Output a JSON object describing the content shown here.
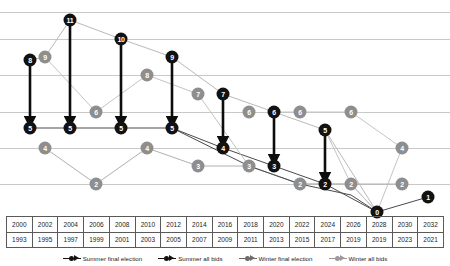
{
  "chart_data": {
    "type": "line",
    "title": "",
    "xlabel": "",
    "ylabel": "",
    "ylim": [
      0,
      12
    ],
    "grid": true,
    "gridline_values": [
      0,
      2,
      4,
      6,
      8,
      10,
      12
    ],
    "legend_position": "bottom",
    "x_axis": {
      "summer_years": [
        "2000",
        "2002",
        "2004",
        "2006",
        "2008",
        "2010",
        "2012",
        "2014",
        "2016",
        "2018",
        "2020",
        "2022",
        "2024",
        "2026",
        "2028",
        "2030",
        "2032"
      ],
      "winter_years": [
        "1993",
        "1995",
        "1997",
        "1999",
        "2001",
        "2003",
        "2005",
        "2007",
        "2009",
        "2011",
        "2013",
        "2015",
        "2017",
        "2019",
        "2019",
        "2023",
        "2021"
      ]
    },
    "series": [
      {
        "name": "Summer final election",
        "color": "#121212",
        "style": "dark",
        "points": [
          {
            "x": "2000",
            "value": 5
          },
          {
            "x": "2004",
            "value": 5
          },
          {
            "x": "2008",
            "value": 5
          },
          {
            "x": "2012",
            "value": 5
          },
          {
            "x": "2016",
            "value": 4
          },
          {
            "x": "2020",
            "value": 3
          },
          {
            "x": "2024",
            "value": 2
          },
          {
            "x": "2028",
            "value": 0
          },
          {
            "x": "2032",
            "value": 1
          }
        ]
      },
      {
        "name": "Summer all bids",
        "color": "#8e8e8e",
        "style": "gray",
        "points": [
          {
            "x": "2000",
            "value": 8
          },
          {
            "x": "2002",
            "value": 9
          },
          {
            "x": "2004",
            "value": 11
          },
          {
            "x": "2008",
            "value": 10
          },
          {
            "x": "2012",
            "value": 9
          },
          {
            "x": "2016",
            "value": 7
          },
          {
            "x": "2020",
            "value": 6
          },
          {
            "x": "2024",
            "value": 5
          },
          {
            "x": "2028",
            "value": 0
          }
        ]
      },
      {
        "name": "Winter final election",
        "color": "#121212",
        "style": "dark",
        "points": [
          {
            "x": "1993",
            "value": 4
          },
          {
            "x": "1999",
            "value": 2
          },
          {
            "x": "2003",
            "value": 4
          },
          {
            "x": "2009",
            "value": 3
          },
          {
            "x": "2013",
            "value": 3
          },
          {
            "x": "2017",
            "value": 2
          },
          {
            "x": "2021",
            "value": 2
          }
        ]
      },
      {
        "name": "Winter all bids",
        "color": "#8e8e8e",
        "style": "gray",
        "points": [
          {
            "x": "1995",
            "value": 6
          },
          {
            "x": "2001",
            "value": 8
          },
          {
            "x": "2005",
            "value": 7
          },
          {
            "x": "2011",
            "value": 6
          },
          {
            "x": "2015",
            "value": 6
          },
          {
            "x": "2019",
            "value": 6
          },
          {
            "x": "2023",
            "value": 4
          }
        ]
      }
    ],
    "markers": [
      {
        "id": "m1",
        "label": "8",
        "tone": "dark",
        "x": 30,
        "y": 60
      },
      {
        "id": "m2",
        "label": "5",
        "tone": "dark",
        "x": 30,
        "y": 128
      },
      {
        "id": "m3",
        "label": "9",
        "tone": "gray",
        "x": 45,
        "y": 57
      },
      {
        "id": "m4",
        "label": "11",
        "tone": "dark",
        "x": 70,
        "y": 20
      },
      {
        "id": "m5",
        "label": "5",
        "tone": "dark",
        "x": 70,
        "y": 128
      },
      {
        "id": "m6",
        "label": "6",
        "tone": "gray",
        "x": 96,
        "y": 112
      },
      {
        "id": "m7",
        "label": "10",
        "tone": "dark",
        "x": 121,
        "y": 39
      },
      {
        "id": "m8",
        "label": "5",
        "tone": "dark",
        "x": 121,
        "y": 128
      },
      {
        "id": "m9",
        "label": "8",
        "tone": "gray",
        "x": 147,
        "y": 75
      },
      {
        "id": "m10",
        "label": "9",
        "tone": "dark",
        "x": 172,
        "y": 57
      },
      {
        "id": "m11",
        "label": "5",
        "tone": "dark",
        "x": 172,
        "y": 128
      },
      {
        "id": "m12",
        "label": "7",
        "tone": "gray",
        "x": 198,
        "y": 94
      },
      {
        "id": "m13",
        "label": "7",
        "tone": "dark",
        "x": 223,
        "y": 94
      },
      {
        "id": "m14",
        "label": "4",
        "tone": "dark",
        "x": 223,
        "y": 148
      },
      {
        "id": "m15",
        "label": "6",
        "tone": "gray",
        "x": 249,
        "y": 112
      },
      {
        "id": "m16",
        "label": "6",
        "tone": "dark",
        "x": 274,
        "y": 112
      },
      {
        "id": "m17",
        "label": "3",
        "tone": "dark",
        "x": 274,
        "y": 166
      },
      {
        "id": "m18",
        "label": "6",
        "tone": "gray",
        "x": 300,
        "y": 112
      },
      {
        "id": "m19",
        "label": "5",
        "tone": "dark",
        "x": 325,
        "y": 130
      },
      {
        "id": "m20",
        "label": "2",
        "tone": "dark",
        "x": 325,
        "y": 184
      },
      {
        "id": "m21",
        "label": "6",
        "tone": "gray",
        "x": 351,
        "y": 112
      },
      {
        "id": "m22",
        "label": "0",
        "tone": "dark",
        "x": 377,
        "y": 212
      },
      {
        "id": "m23",
        "label": "4",
        "tone": "gray",
        "x": 402,
        "y": 148
      },
      {
        "id": "m24",
        "label": "1",
        "tone": "dark",
        "x": 428,
        "y": 197
      },
      {
        "id": "m25",
        "label": "4",
        "tone": "gray",
        "x": 45,
        "y": 148
      },
      {
        "id": "m26",
        "label": "2",
        "tone": "gray",
        "x": 96,
        "y": 184
      },
      {
        "id": "m27",
        "label": "4",
        "tone": "gray",
        "x": 147,
        "y": 148
      },
      {
        "id": "m28",
        "label": "3",
        "tone": "gray",
        "x": 198,
        "y": 166
      },
      {
        "id": "m29",
        "label": "3",
        "tone": "gray",
        "x": 249,
        "y": 166
      },
      {
        "id": "m30",
        "label": "2",
        "tone": "gray",
        "x": 300,
        "y": 184
      },
      {
        "id": "m31",
        "label": "2",
        "tone": "gray",
        "x": 351,
        "y": 184
      },
      {
        "id": "m32",
        "label": "2",
        "tone": "gray",
        "x": 402,
        "y": 184
      }
    ],
    "arrows": [
      {
        "x": 30,
        "y1": 60,
        "y2": 128
      },
      {
        "x": 70,
        "y1": 20,
        "y2": 128
      },
      {
        "x": 121,
        "y1": 39,
        "y2": 128
      },
      {
        "x": 172,
        "y1": 57,
        "y2": 128
      },
      {
        "x": 223,
        "y1": 94,
        "y2": 148
      },
      {
        "x": 274,
        "y1": 112,
        "y2": 166
      },
      {
        "x": 325,
        "y1": 130,
        "y2": 184
      }
    ]
  },
  "legend": {
    "items": [
      {
        "label": "Summer final election",
        "color": "#121212"
      },
      {
        "label": "Summer all bids",
        "color": "#121212"
      },
      {
        "label": "Winter final election",
        "color": "#6b6b6b"
      },
      {
        "label": "Winter all bids",
        "color": "#9a9a9a"
      }
    ]
  }
}
